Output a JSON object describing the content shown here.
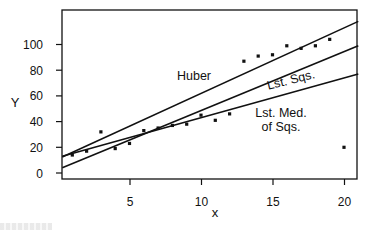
{
  "chart_data": {
    "type": "scatter",
    "title": "",
    "xlabel": "x",
    "ylabel": "Y",
    "xlim": [
      0.3,
      21
    ],
    "ylim": [
      -5,
      127
    ],
    "x_ticks": [
      5,
      10,
      15,
      20
    ],
    "y_ticks": [
      0,
      20,
      40,
      60,
      80,
      100
    ],
    "grid": false,
    "legend": "none (lines labeled inline)",
    "points": {
      "x": [
        1,
        2,
        3,
        4,
        5,
        6,
        7,
        8,
        9,
        10,
        11,
        12,
        13,
        14,
        15,
        16,
        17,
        18,
        19,
        20
      ],
      "y": [
        14,
        17,
        32,
        19,
        23,
        33,
        35,
        37,
        38,
        45,
        41,
        46,
        87,
        91,
        92,
        99,
        97,
        99,
        104,
        20
      ]
    },
    "series": [
      {
        "name": "Huber",
        "type": "line",
        "x": [
          0.3,
          21
        ],
        "y": [
          12.5,
          118
        ]
      },
      {
        "name": "Lst. Sqs.",
        "type": "line",
        "x": [
          0.3,
          21
        ],
        "y": [
          4,
          99
        ]
      },
      {
        "name": "Lst. Med. of Sqs.",
        "type": "line",
        "x": [
          0.3,
          21
        ],
        "y": [
          13,
          77
        ]
      }
    ],
    "annotations": [
      {
        "text": "Huber",
        "x": 9.5,
        "y": 75
      },
      {
        "text": "Lst. Sqs.",
        "x": 16.2,
        "y": 73
      },
      {
        "text": "Lst. Med.",
        "x": 15.5,
        "y": 46
      },
      {
        "text": "of Sqs.",
        "x": 15.5,
        "y": 35
      }
    ]
  },
  "labels": {
    "xlabel": "x",
    "ylabel": "Y",
    "x_ticks": [
      "5",
      "10",
      "15",
      "20"
    ],
    "y_ticks": [
      "0",
      "20",
      "40",
      "60",
      "80",
      "100"
    ],
    "huber": "Huber",
    "lst_sqs": "Lst. Sqs.",
    "lms_line1": "Lst. Med.",
    "lms_line2": "of Sqs."
  }
}
